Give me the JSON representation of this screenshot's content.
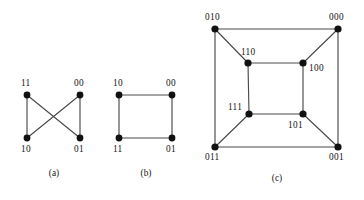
{
  "figure": {
    "background_color": "#ffffff",
    "edge_color": "#4a4a4a",
    "vertex_color": "#111111",
    "label_color": "#141414",
    "panels": [
      {
        "id": "panel-a",
        "caption": "(a)",
        "caption_x": 54,
        "caption_y": 176,
        "vertices": [
          {
            "id": "a-11",
            "label": "11",
            "x": 27,
            "y": 95,
            "r": 3.4,
            "label_x": 21,
            "label_y": 86,
            "label_anchor": "start"
          },
          {
            "id": "a-00",
            "label": "00",
            "x": 80,
            "y": 95,
            "r": 3.4,
            "label_x": 74,
            "label_y": 86,
            "label_anchor": "start"
          },
          {
            "id": "a-10",
            "label": "10",
            "x": 27,
            "y": 138,
            "r": 3.4,
            "label_x": 21,
            "label_y": 152,
            "label_anchor": "start"
          },
          {
            "id": "a-01",
            "label": "01",
            "x": 80,
            "y": 138,
            "r": 3.4,
            "label_x": 74,
            "label_y": 152,
            "label_anchor": "start"
          }
        ],
        "edges": [
          {
            "id": "a-e1",
            "from": "a-11",
            "to": "a-10"
          },
          {
            "id": "a-e2",
            "from": "a-00",
            "to": "a-01"
          },
          {
            "id": "a-e3",
            "from": "a-11",
            "to": "a-01"
          },
          {
            "id": "a-e4",
            "from": "a-00",
            "to": "a-10"
          }
        ]
      },
      {
        "id": "panel-b",
        "caption": "(b)",
        "caption_x": 146,
        "caption_y": 176,
        "vertices": [
          {
            "id": "b-10",
            "label": "10",
            "x": 119,
            "y": 95,
            "r": 3.4,
            "label_x": 113,
            "label_y": 86,
            "label_anchor": "start"
          },
          {
            "id": "b-00",
            "label": "00",
            "x": 172,
            "y": 95,
            "r": 3.4,
            "label_x": 166,
            "label_y": 86,
            "label_anchor": "start"
          },
          {
            "id": "b-11",
            "label": "11",
            "x": 119,
            "y": 138,
            "r": 3.4,
            "label_x": 113,
            "label_y": 152,
            "label_anchor": "start"
          },
          {
            "id": "b-01",
            "label": "01",
            "x": 172,
            "y": 138,
            "r": 3.4,
            "label_x": 166,
            "label_y": 152,
            "label_anchor": "start"
          }
        ],
        "edges": [
          {
            "id": "b-e1",
            "from": "b-10",
            "to": "b-00"
          },
          {
            "id": "b-e2",
            "from": "b-00",
            "to": "b-01"
          },
          {
            "id": "b-e3",
            "from": "b-01",
            "to": "b-11"
          },
          {
            "id": "b-e4",
            "from": "b-11",
            "to": "b-10"
          }
        ]
      },
      {
        "id": "panel-c",
        "caption": "(c)",
        "caption_x": 277,
        "caption_y": 181,
        "vertices": [
          {
            "id": "c-010",
            "label": "010",
            "x": 215,
            "y": 29,
            "r": 3.6,
            "label_x": 205,
            "label_y": 20,
            "label_anchor": "start"
          },
          {
            "id": "c-000",
            "label": "000",
            "x": 338,
            "y": 29,
            "r": 3.6,
            "label_x": 329,
            "label_y": 20,
            "label_anchor": "start"
          },
          {
            "id": "c-011",
            "label": "011",
            "x": 215,
            "y": 147,
            "r": 3.6,
            "label_x": 205,
            "label_y": 160,
            "label_anchor": "start"
          },
          {
            "id": "c-001",
            "label": "001",
            "x": 338,
            "y": 147,
            "r": 3.6,
            "label_x": 329,
            "label_y": 160,
            "label_anchor": "start"
          },
          {
            "id": "c-110",
            "label": "110",
            "x": 248,
            "y": 63,
            "r": 3.6,
            "label_x": 241,
            "label_y": 55,
            "label_anchor": "start"
          },
          {
            "id": "c-100",
            "label": "100",
            "x": 303,
            "y": 63,
            "r": 3.6,
            "label_x": 309,
            "label_y": 71,
            "label_anchor": "start"
          },
          {
            "id": "c-111",
            "label": "111",
            "x": 249,
            "y": 114,
            "r": 3.6,
            "label_x": 228,
            "label_y": 110,
            "label_anchor": "start"
          },
          {
            "id": "c-101",
            "label": "101",
            "x": 303,
            "y": 114,
            "r": 3.6,
            "label_x": 288,
            "label_y": 128,
            "label_anchor": "start"
          }
        ],
        "edges": [
          {
            "id": "c-e1",
            "from": "c-010",
            "to": "c-000"
          },
          {
            "id": "c-e2",
            "from": "c-000",
            "to": "c-001"
          },
          {
            "id": "c-e3",
            "from": "c-001",
            "to": "c-011"
          },
          {
            "id": "c-e4",
            "from": "c-011",
            "to": "c-010"
          },
          {
            "id": "c-e5",
            "from": "c-110",
            "to": "c-100"
          },
          {
            "id": "c-e6",
            "from": "c-100",
            "to": "c-101"
          },
          {
            "id": "c-e7",
            "from": "c-101",
            "to": "c-111"
          },
          {
            "id": "c-e8",
            "from": "c-111",
            "to": "c-110"
          },
          {
            "id": "c-e9",
            "from": "c-010",
            "to": "c-110"
          },
          {
            "id": "c-e10",
            "from": "c-000",
            "to": "c-100"
          },
          {
            "id": "c-e11",
            "from": "c-001",
            "to": "c-101"
          },
          {
            "id": "c-e12",
            "from": "c-011",
            "to": "c-111"
          }
        ]
      }
    ]
  }
}
